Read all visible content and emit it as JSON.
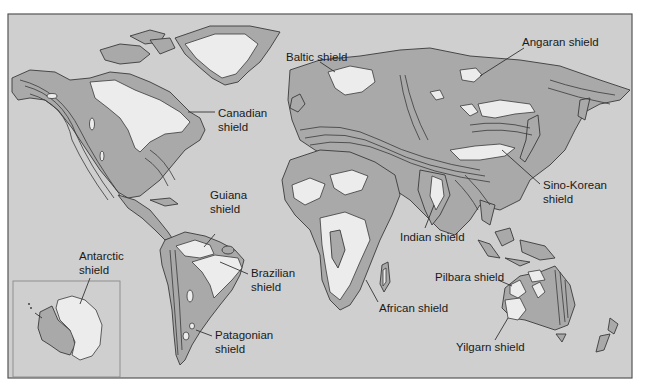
{
  "figure": {
    "type": "world-map",
    "colors": {
      "ocean": "#cfcfcf",
      "orogenic_belts": "#a9a9a9",
      "shields": "#ececec",
      "outline": "#3a3a3a",
      "frame": "#555555"
    }
  },
  "labels": {
    "canadian": [
      "Canadian",
      "shield"
    ],
    "baltic": "Baltic shield",
    "angaran": "Angaran shield",
    "guiana": [
      "Guiana",
      "shield"
    ],
    "sino_korean": [
      "Sino-Korean",
      "shield"
    ],
    "indian": "Indian shield",
    "antarctic": [
      "Antarctic",
      "shield"
    ],
    "brazilian": [
      "Brazilian",
      "shield"
    ],
    "african": "African shield",
    "pilbara": "Pilbara shield",
    "patagonian": [
      "Patagonian",
      "shield"
    ],
    "yilgarn": "Yilgarn shield"
  },
  "inset": {
    "name": "Antarctica inset"
  }
}
